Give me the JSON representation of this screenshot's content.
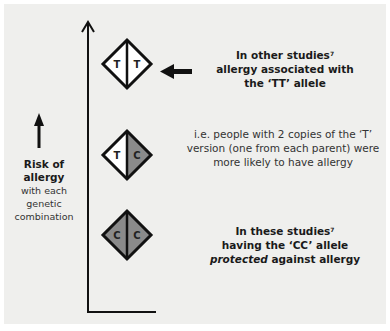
{
  "diagram": {
    "axis": {
      "direction": "up",
      "label": "Risk of allergy"
    },
    "genotypes": [
      {
        "id": "TT",
        "left": "T",
        "right": "T",
        "left_color": "#ffffff",
        "right_color": "#ffffff"
      },
      {
        "id": "TC",
        "left": "T",
        "right": "C",
        "left_color": "#ffffff",
        "right_color": "#8a8a8a"
      },
      {
        "id": "CC",
        "left": "C",
        "right": "C",
        "left_color": "#8a8a8a",
        "right_color": "#8a8a8a"
      }
    ],
    "risk_label": {
      "line1": "Risk of",
      "line2": "allergy",
      "line3": "with each",
      "line4": "genetic",
      "line5": "combination"
    },
    "annotations": {
      "tt": {
        "line1": "In other studies",
        "sup": "7",
        "line2": "allergy associated with",
        "line3": "the ‘TT’ allele"
      },
      "tc": {
        "line1": "i.e. people with 2 copies of the ‘T’",
        "line2": "version (one from each parent) were",
        "line3": "more likely to have allergy"
      },
      "cc": {
        "line1": "In these studies",
        "sup": "7",
        "line2": "having the ‘CC’ allele",
        "line3_italic": "protected",
        "line3_rest": " against allergy"
      }
    }
  }
}
